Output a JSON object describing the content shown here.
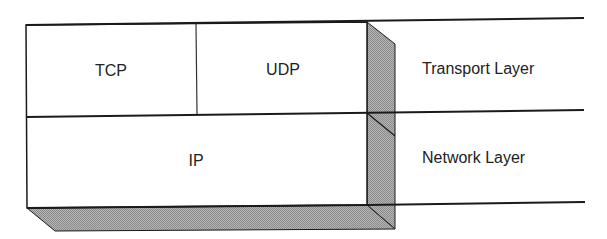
{
  "diagram": {
    "colors": {
      "background": "#ffffff",
      "line": "#1a1a1a",
      "side_fill": "#a9a9a9",
      "text": "#222222"
    },
    "boxes": [
      {
        "id": "tcp",
        "label": "TCP",
        "layer": "transport"
      },
      {
        "id": "udp",
        "label": "UDP",
        "layer": "transport"
      },
      {
        "id": "ip",
        "label": "IP",
        "layer": "network"
      }
    ],
    "layers": [
      {
        "id": "transport",
        "label": "Transport Layer"
      },
      {
        "id": "network",
        "label": "Network Layer"
      }
    ]
  }
}
